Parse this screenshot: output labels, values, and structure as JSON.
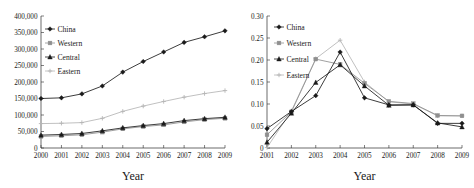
{
  "figure": {
    "panels": [
      "left",
      "right"
    ]
  },
  "chart_data": [
    {
      "panel": "left",
      "type": "line",
      "title": "",
      "xlabel": "Year",
      "ylabel": "",
      "x": [
        2000,
        2001,
        2002,
        2003,
        2004,
        2005,
        2006,
        2007,
        2008,
        2009
      ],
      "xticklabels": [
        "2000",
        "2001",
        "2002",
        "2003",
        "2004",
        "2005",
        "2006",
        "2007",
        "2008",
        "2009"
      ],
      "yticklabels": [
        "0",
        "50,000",
        "100,000",
        "150,000",
        "200,000",
        "250,000",
        "300,000",
        "350,000",
        "400,000"
      ],
      "ytickvalues": [
        0,
        50000,
        100000,
        150000,
        200000,
        250000,
        300000,
        350000,
        400000
      ],
      "ylim": [
        0,
        400000
      ],
      "xlim": [
        2000,
        2009
      ],
      "grid": false,
      "legend_position": "upper-left",
      "series": [
        {
          "name": "China",
          "marker": "diamond",
          "color": "#1a1a1a",
          "values": [
            150000,
            152000,
            164000,
            188000,
            230000,
            262000,
            291000,
            320000,
            337000,
            355000
          ]
        },
        {
          "name": "Western",
          "marker": "square",
          "color": "#8f8f8f",
          "values": [
            35000,
            37000,
            40000,
            48000,
            58000,
            65000,
            70000,
            79000,
            86000,
            90000
          ]
        },
        {
          "name": "Central",
          "marker": "triangle",
          "color": "#1a1a1a",
          "values": [
            39000,
            41000,
            44000,
            52000,
            61000,
            68000,
            74000,
            83000,
            89000,
            93000
          ]
        },
        {
          "name": "Eastern",
          "marker": "plus",
          "color": "#b5b5b5",
          "values": [
            74000,
            75000,
            77000,
            90000,
            111000,
            127000,
            141000,
            154000,
            165000,
            174000
          ]
        }
      ]
    },
    {
      "panel": "right",
      "type": "line",
      "title": "",
      "xlabel": "Year",
      "ylabel": "",
      "x": [
        2001,
        2002,
        2003,
        2004,
        2005,
        2006,
        2007,
        2008,
        2009
      ],
      "xticklabels": [
        "2001",
        "2002",
        "2003",
        "2004",
        "2005",
        "2006",
        "2007",
        "2008",
        "2009"
      ],
      "yticklabels": [
        "0",
        "0.05",
        "0.10",
        "0.15",
        "0.20",
        "0.25",
        "0.30"
      ],
      "ytickvalues": [
        0,
        0.05,
        0.1,
        0.15,
        0.2,
        0.25,
        0.3
      ],
      "ylim": [
        0,
        0.3
      ],
      "xlim": [
        2001,
        2009
      ],
      "grid": false,
      "legend_position": "upper-left",
      "series": [
        {
          "name": "China",
          "marker": "diamond",
          "color": "#1a1a1a",
          "values": [
            0.044,
            0.083,
            0.119,
            0.218,
            0.114,
            0.098,
            0.098,
            0.056,
            0.056
          ]
        },
        {
          "name": "Western",
          "marker": "square",
          "color": "#8f8f8f",
          "values": [
            0.03,
            0.082,
            0.202,
            0.19,
            0.147,
            0.106,
            0.101,
            0.074,
            0.073
          ]
        },
        {
          "name": "Central",
          "marker": "triangle",
          "color": "#1a1a1a",
          "values": [
            0.013,
            0.079,
            0.149,
            0.189,
            0.141,
            0.097,
            0.098,
            0.057,
            0.048
          ]
        },
        {
          "name": "Eastern",
          "marker": "plus",
          "color": "#b5b5b5",
          "values": [
            0.001,
            0.084,
            0.203,
            0.245,
            0.15,
            0.105,
            0.1,
            0.073,
            0.073
          ]
        }
      ]
    }
  ]
}
